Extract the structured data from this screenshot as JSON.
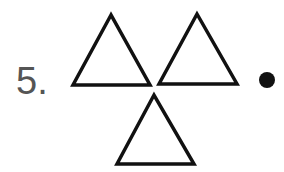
{
  "item": {
    "number_label": "5.",
    "shapes": [
      {
        "type": "triangle",
        "points": "111,15 73,85 150,85"
      },
      {
        "type": "triangle",
        "points": "197,14 159,84 237,84"
      },
      {
        "type": "triangle",
        "points": "154,95 117,164 194,164"
      }
    ],
    "dot": {
      "cx": 267,
      "cy": 80,
      "r": 8
    },
    "stroke_color": "#111111",
    "number_color": "#555555"
  }
}
